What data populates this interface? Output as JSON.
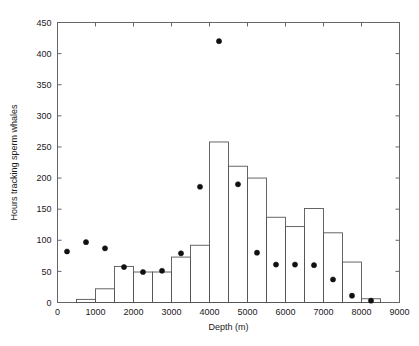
{
  "chart_data": {
    "type": "bar",
    "title": "",
    "xlabel": "Depth (m)",
    "ylabel": "Hours tracking sperm whales",
    "xlim": [
      0,
      9000
    ],
    "ylim": [
      0,
      450
    ],
    "grid": false,
    "legend": "none",
    "xticks": [
      0,
      1000,
      2000,
      3000,
      4000,
      5000,
      6000,
      7000,
      8000,
      9000
    ],
    "xtick_labels": [
      "0",
      "1000",
      "2000",
      "3000",
      "4000",
      "5000",
      "6000",
      "7000",
      "8000",
      "9000"
    ],
    "yticks": [
      0,
      50,
      100,
      150,
      200,
      250,
      300,
      350,
      400,
      450
    ],
    "ytick_labels": [
      "0",
      "50",
      "100",
      "150",
      "200",
      "250",
      "300",
      "350",
      "400",
      "450"
    ],
    "bin_width": 500,
    "bin_edges": [
      0,
      500,
      1000,
      1500,
      2000,
      2500,
      3000,
      3500,
      4000,
      4500,
      5000,
      5500,
      6000,
      6500,
      7000,
      7500,
      8000,
      8500
    ],
    "series": [
      {
        "name": "Hours tracking sperm whales",
        "type": "bar",
        "bin_starts": [
          0,
          500,
          1000,
          1500,
          2000,
          2500,
          3000,
          3500,
          4000,
          4500,
          5000,
          5500,
          6000,
          6500,
          7000,
          7500,
          8000
        ],
        "values": [
          0,
          5,
          22,
          58,
          49,
          49,
          73,
          92,
          258,
          219,
          200,
          137,
          122,
          151,
          112,
          65,
          6
        ]
      },
      {
        "name": "point-markers",
        "type": "scatter",
        "x": [
          250,
          750,
          1250,
          1750,
          2250,
          2750,
          3250,
          3750,
          4250,
          4750,
          5250,
          5750,
          6250,
          6750,
          7250,
          7750,
          8250
        ],
        "values": [
          82,
          97,
          87,
          57,
          49,
          51,
          79,
          186,
          420,
          190,
          80,
          61,
          61,
          60,
          37,
          11,
          3
        ]
      }
    ],
    "colors": {
      "bar_edge": "#555555",
      "bar_fill": "none",
      "marker": "#111111",
      "axis": "#666666",
      "text": "#1a1a1a",
      "background": "#ffffff"
    }
  }
}
